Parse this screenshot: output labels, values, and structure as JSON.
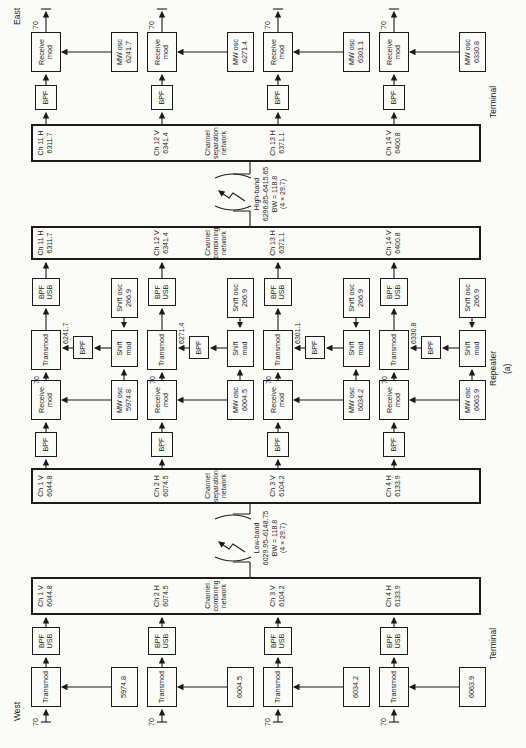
{
  "compass": {
    "west": "West",
    "east": "East"
  },
  "if_freq": "70",
  "section_labels": {
    "west_terminal": "Terminal",
    "repeater": "Repeater",
    "east_terminal": "Terminal",
    "caption": "(a)"
  },
  "networks": {
    "low_combining": [
      "Channel",
      "combining",
      "network"
    ],
    "low_separation": [
      "Channel",
      "separation",
      "network"
    ],
    "high_combining": [
      "Channel",
      "combining",
      "network"
    ],
    "high_separation": [
      "Channel",
      "separation",
      "network"
    ]
  },
  "bands": {
    "low": {
      "name": "Low-band",
      "range": "6029.95–6148.75",
      "bw": "BW = 118.8",
      "factor": "(4 × 29.7)"
    },
    "high": {
      "name": "High-band",
      "range": "6296.85–6415.65",
      "bw": "BW = 118.8",
      "factor": "(4 × 29.7)"
    }
  },
  "blocks": {
    "transmod": "Transmod",
    "receive_mod": [
      "Receive",
      "mod"
    ],
    "bpf": "BPF",
    "bpf_usb": [
      "BPF",
      "USB"
    ],
    "mw_osc": "MW osc",
    "shift_mod": [
      "Shift",
      "mod"
    ],
    "shift_osc": [
      "Shift osc",
      "266.9"
    ]
  },
  "rows": [
    {
      "west_osc": "5974.8",
      "low_channel": [
        "Ch 1 V",
        "6044.8"
      ],
      "repeater_rx_osc": "5974.8",
      "shift_output": "6241.7",
      "high_channel": [
        "Ch 11 H",
        "6311.7"
      ],
      "east_osc": "6241.7"
    },
    {
      "west_osc": "6004.5",
      "low_channel": [
        "Ch 2 H",
        "6074.5"
      ],
      "repeater_rx_osc": "6004.5",
      "shift_output": "6271.4",
      "high_channel": [
        "Ch 12 V",
        "6341.4"
      ],
      "east_osc": "6271.4"
    },
    {
      "west_osc": "6034.2",
      "low_channel": [
        "Ch 3 V",
        "6104.2"
      ],
      "repeater_rx_osc": "6034.2",
      "shift_output": "6301.1",
      "high_channel": [
        "Ch 13 H",
        "6371.1"
      ],
      "east_osc": "6301.1"
    },
    {
      "west_osc": "6063.9",
      "low_channel": [
        "Ch 4 H",
        "6133.9"
      ],
      "repeater_rx_osc": "6063.9",
      "shift_output": "6330.8",
      "high_channel": [
        "Ch 14 V",
        "6400.8"
      ],
      "east_osc": "6330.8"
    }
  ]
}
